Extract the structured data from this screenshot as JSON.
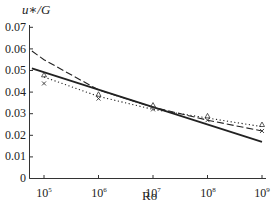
{
  "chart_data": {
    "type": "line",
    "title": "",
    "xlabel": "Ro",
    "ylabel": "u*/G",
    "xscale": "log",
    "xlim": [
      100000,
      1000000000
    ],
    "ylim": [
      0,
      0.07
    ],
    "x_ticks": [
      "10^5",
      "10^6",
      "10^7",
      "10^8",
      "10^9"
    ],
    "y_ticks": [
      "0",
      "0.01",
      "0.02",
      "0.03",
      "0.04",
      "0.05",
      "0.06",
      "0.07"
    ],
    "grid": false,
    "legend": "none",
    "series": [
      {
        "name": "solid",
        "style": "solid",
        "x": [
          60000,
          1000000000
        ],
        "y": [
          0.051,
          0.017
        ]
      },
      {
        "name": "dashed",
        "style": "dashed",
        "x": [
          60000,
          100000,
          1000000,
          10000000,
          100000000,
          1000000000
        ],
        "y": [
          0.059,
          0.055,
          0.041,
          0.033,
          0.027,
          0.022
        ]
      },
      {
        "name": "dotted",
        "style": "dotted",
        "x": [
          100000,
          1000000,
          10000000,
          100000000,
          1000000000
        ],
        "y": [
          0.047,
          0.038,
          0.032,
          0.028,
          0.024
        ]
      },
      {
        "name": "triangle markers",
        "style": "markers",
        "marker": "triangle",
        "x": [
          100000,
          1000000,
          10000000,
          100000000,
          1000000000
        ],
        "y": [
          0.048,
          0.039,
          0.034,
          0.029,
          0.025
        ]
      },
      {
        "name": "cross markers",
        "style": "markers",
        "marker": "x",
        "x": [
          100000,
          1000000,
          10000000,
          100000000,
          1000000000
        ],
        "y": [
          0.044,
          0.037,
          0.032,
          0.027,
          0.022
        ]
      }
    ]
  },
  "axes": {
    "ylabel_text": "u∗/G",
    "xlabel_text": "Ro",
    "yticks": [
      "0.07",
      "0.06",
      "0.05",
      "0.04",
      "0.03",
      "0.02",
      "0.01",
      "0"
    ],
    "xticks_base": [
      "10",
      "10",
      "10",
      "10",
      "10"
    ],
    "xticks_exp": [
      "5",
      "6",
      "7",
      "8",
      "9"
    ]
  }
}
